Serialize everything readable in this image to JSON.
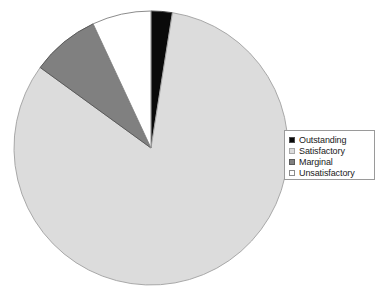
{
  "chart_data": {
    "type": "pie",
    "title": "",
    "categories": [
      "Outstanding",
      "Satisfactory",
      "Marginal",
      "Unsatisfactory"
    ],
    "values": [
      2.5,
      82.5,
      8.0,
      7.0
    ],
    "unit": "percent",
    "start_angle_deg": 0,
    "direction": "clockwise",
    "legend_position": "right",
    "grid": false,
    "slices": [
      {
        "label": "Outstanding",
        "value": 2.5,
        "color": "#0a0a0a",
        "border": "#4a4a4a",
        "start_deg": 0,
        "end_deg": 9
      },
      {
        "label": "Satisfactory",
        "value": 82.5,
        "color": "#dcdcdc",
        "border": "#a8a8a8",
        "start_deg": 9,
        "end_deg": 306
      },
      {
        "label": "Marginal",
        "value": 8.0,
        "color": "#808080",
        "border": "#5a5a5a",
        "start_deg": 306,
        "end_deg": 335
      },
      {
        "label": "Unsatisfactory",
        "value": 7.0,
        "color": "#ffffff",
        "border": "#8c8c8c",
        "start_deg": 335,
        "end_deg": 360
      }
    ],
    "geometry": {
      "center_x": 151,
      "center_y": 148,
      "radius": 137
    }
  },
  "legend": {
    "items": [
      {
        "label": "Outstanding",
        "marker": "filled-square-black"
      },
      {
        "label": "Satisfactory",
        "marker": "open-square-light"
      },
      {
        "label": "Marginal",
        "marker": "filled-square-gray"
      },
      {
        "label": "Unsatisfactory",
        "marker": "open-square-white"
      }
    ]
  }
}
